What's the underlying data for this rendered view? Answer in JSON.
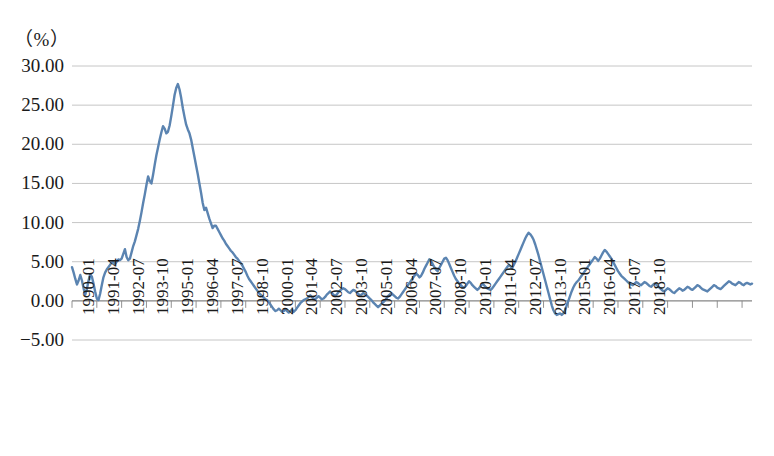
{
  "chart_data": {
    "type": "line",
    "title": "",
    "subtitle": "",
    "unit_label": "（%）",
    "xlabel": "",
    "ylabel": "",
    "ylim": [
      -5.0,
      30.0
    ],
    "y_ticks": [
      30.0,
      25.0,
      20.0,
      15.0,
      10.0,
      5.0,
      0.0,
      -5.0
    ],
    "y_tick_labels": [
      "30.00",
      "25.00",
      "20.00",
      "15.00",
      "10.00",
      "5.00",
      "0.00",
      "-5.00"
    ],
    "grid": true,
    "legend": "none",
    "line_color": "#5B84B1",
    "grid_color": "#BFBFBF",
    "axis_color": "#868686",
    "x_tick_labels": [
      "1990-01",
      "1991-04",
      "1992-07",
      "1993-10",
      "1995-01",
      "1996-04",
      "1997-07",
      "1998-10",
      "2000-01",
      "2001-04",
      "2002-07",
      "2003-10",
      "2005-01",
      "2006-04",
      "2007-07",
      "2008-10",
      "2010-01",
      "2011-04",
      "2012-07",
      "2013-10",
      "2015-01",
      "2016-04",
      "2017-07",
      "2018-10"
    ],
    "x_tick_interval_months": 15,
    "x_start": "1990-01",
    "x_end": "2019-04",
    "series": [
      {
        "name": "",
        "values": [
          4.3,
          3.6,
          2.8,
          2.1,
          2.6,
          3.3,
          2.6,
          1.6,
          0.8,
          1.5,
          2.6,
          3.4,
          3.1,
          2.2,
          1.2,
          0.3,
          0.1,
          0.9,
          2.0,
          3.0,
          3.6,
          4.0,
          4.3,
          4.6,
          4.9,
          5.0,
          4.7,
          5.0,
          5.3,
          5.2,
          5.4,
          6.0,
          6.6,
          5.6,
          5.2,
          5.4,
          6.2,
          7.0,
          7.6,
          8.4,
          9.2,
          10.2,
          11.3,
          12.5,
          13.6,
          14.8,
          15.9,
          15.3,
          15.0,
          16.1,
          17.4,
          18.6,
          19.6,
          20.6,
          21.5,
          22.3,
          22.0,
          21.4,
          21.6,
          22.4,
          23.6,
          24.9,
          26.3,
          27.2,
          27.7,
          27.0,
          25.9,
          24.6,
          23.5,
          22.5,
          21.9,
          21.4,
          20.6,
          19.5,
          18.4,
          17.3,
          16.2,
          15.0,
          13.8,
          12.5,
          11.6,
          11.9,
          11.2,
          10.5,
          9.9,
          9.3,
          9.6,
          9.6,
          9.2,
          8.8,
          8.4,
          8.0,
          7.7,
          7.3,
          7.0,
          6.7,
          6.4,
          6.2,
          5.9,
          5.6,
          5.4,
          5.1,
          4.8,
          4.5,
          4.1,
          3.7,
          3.2,
          2.8,
          2.5,
          2.2,
          1.9,
          1.6,
          1.3,
          1.0,
          0.8,
          0.6,
          0.4,
          0.2,
          0.1,
          -0.2,
          -0.5,
          -0.8,
          -1.1,
          -1.3,
          -1.2,
          -1.0,
          -1.2,
          -1.4,
          -1.3,
          -1.1,
          -1.3,
          -1.5,
          -1.3,
          -1.1,
          -1.4,
          -1.2,
          -0.9,
          -0.6,
          -0.3,
          -0.1,
          0.1,
          0.2,
          0.3,
          0.5,
          0.7,
          0.5,
          0.3,
          0.2,
          0.4,
          0.6,
          0.4,
          0.2,
          0.3,
          0.5,
          0.8,
          1.0,
          1.2,
          1.0,
          0.8,
          0.6,
          0.8,
          1.1,
          1.3,
          1.5,
          1.6,
          1.5,
          1.3,
          1.1,
          1.0,
          1.2,
          1.4,
          1.3,
          1.1,
          0.9,
          0.7,
          0.8,
          1.0,
          0.9,
          0.7,
          0.5,
          0.3,
          0.1,
          -0.2,
          -0.4,
          -0.6,
          -0.8,
          -0.6,
          -0.4,
          -0.2,
          0.0,
          0.3,
          0.6,
          0.8,
          1.0,
          0.8,
          0.6,
          0.4,
          0.3,
          0.5,
          0.8,
          1.1,
          1.4,
          1.7,
          2.0,
          2.3,
          2.6,
          2.9,
          3.2,
          3.5,
          3.3,
          3.0,
          3.2,
          3.6,
          4.1,
          4.5,
          4.9,
          5.3,
          5.1,
          4.7,
          4.3,
          4.0,
          3.8,
          4.2,
          4.6,
          5.0,
          5.4,
          5.5,
          5.2,
          4.7,
          4.2,
          3.7,
          3.2,
          2.8,
          2.5,
          2.2,
          2.0,
          1.8,
          1.7,
          1.9,
          2.2,
          2.5,
          2.3,
          2.0,
          1.8,
          1.6,
          1.4,
          1.6,
          1.9,
          2.2,
          2.0,
          1.8,
          1.6,
          1.5,
          1.4,
          1.6,
          1.9,
          2.2,
          2.5,
          2.8,
          3.1,
          3.4,
          3.7,
          4.0,
          4.3,
          4.6,
          4.4,
          4.2,
          4.6,
          5.0,
          5.5,
          6.0,
          6.5,
          7.0,
          7.5,
          8.0,
          8.4,
          8.7,
          8.5,
          8.2,
          7.8,
          7.2,
          6.5,
          5.8,
          5.0,
          4.2,
          3.4,
          2.6,
          1.8,
          1.0,
          0.2,
          -0.6,
          -1.2,
          -1.6,
          -1.8,
          -1.7,
          -1.6,
          -1.8,
          -1.6,
          -1.2,
          -0.6,
          0.0,
          0.6,
          1.2,
          1.7,
          2.1,
          2.4,
          2.6,
          2.9,
          3.2,
          3.5,
          3.8,
          4.1,
          4.4,
          4.7,
          5.0,
          5.3,
          5.6,
          5.4,
          5.1,
          5.4,
          5.8,
          6.2,
          6.5,
          6.3,
          6.0,
          5.7,
          5.4,
          5.0,
          4.6,
          4.2,
          3.8,
          3.5,
          3.2,
          3.0,
          2.8,
          2.6,
          2.4,
          2.2,
          2.1,
          2.0,
          2.2,
          2.4,
          2.3,
          2.1,
          2.0,
          2.2,
          2.4,
          2.3,
          2.1,
          1.9,
          1.8,
          2.0,
          2.2,
          2.1,
          1.9,
          1.7,
          1.5,
          1.3,
          1.2,
          1.4,
          1.6,
          1.5,
          1.3,
          1.1,
          1.0,
          1.2,
          1.4,
          1.6,
          1.5,
          1.3,
          1.4,
          1.6,
          1.8,
          1.7,
          1.5,
          1.4,
          1.6,
          1.8,
          2.0,
          1.9,
          1.7,
          1.5,
          1.4,
          1.3,
          1.2,
          1.4,
          1.6,
          1.8,
          2.0,
          1.9,
          1.7,
          1.6,
          1.5,
          1.7,
          1.9,
          2.1,
          2.3,
          2.5,
          2.4,
          2.2,
          2.1,
          2.0,
          2.2,
          2.4,
          2.3,
          2.1,
          2.0,
          2.2,
          2.3,
          2.2,
          2.1,
          2.2
        ]
      }
    ]
  }
}
